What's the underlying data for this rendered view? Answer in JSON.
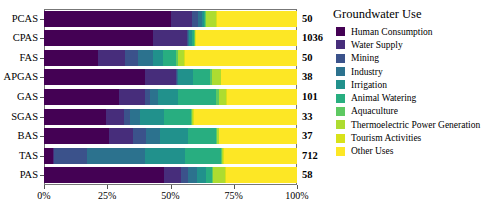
{
  "chart_data": {
    "type": "bar",
    "orientation": "horizontal",
    "stacked": true,
    "normalized": true,
    "title": "",
    "xlabel": "",
    "ylabel": "",
    "xlim": [
      0,
      100
    ],
    "xtick_labels": [
      "0%",
      "25%",
      "50%",
      "75%",
      "100%"
    ],
    "xtick_values": [
      0,
      25,
      50,
      75,
      100
    ],
    "grid": false,
    "legend_position": "right",
    "legend_title": "Groundwater Use",
    "categories": [
      "PCAS",
      "CPAS",
      "FAS",
      "APGAS",
      "GAS",
      "SGAS",
      "BAS",
      "TAS",
      "PAS"
    ],
    "value_labels": [
      "50",
      "1036",
      "50",
      "38",
      "101",
      "33",
      "37",
      "712",
      "58"
    ],
    "series": [
      {
        "name": "Human Consumption",
        "color": "#440154",
        "values": [
          50.0,
          43.0,
          21.5,
          40.0,
          29.5,
          24.5,
          25.5,
          3.5,
          47.5
        ]
      },
      {
        "name": "Water Supply",
        "color": "#472d7b",
        "values": [
          8.5,
          13.5,
          10.5,
          12.0,
          10.5,
          7.0,
          9.5,
          0.6,
          6.5
        ]
      },
      {
        "name": "Mining",
        "color": "#3b528b",
        "values": [
          2.5,
          0.4,
          5.0,
          0.4,
          2.0,
          2.5,
          5.5,
          13.0,
          3.0
        ]
      },
      {
        "name": "Industry",
        "color": "#2c728e",
        "values": [
          1.5,
          0.4,
          6.0,
          0.4,
          3.0,
          4.0,
          5.5,
          23.0,
          3.5
        ]
      },
      {
        "name": "Irrigation",
        "color": "#21918c",
        "values": [
          0.6,
          1.2,
          4.0,
          6.0,
          8.0,
          9.5,
          11.0,
          15.5,
          3.5
        ]
      },
      {
        "name": "Animal Watering",
        "color": "#28ae80",
        "values": [
          0.6,
          0.8,
          5.0,
          7.0,
          15.0,
          10.5,
          11.0,
          14.5,
          2.5
        ]
      },
      {
        "name": "Aquaculture",
        "color": "#5ec962",
        "values": [
          0.5,
          0.3,
          0.8,
          0.5,
          1.0,
          0.5,
          0.5,
          0.4,
          0.5
        ]
      },
      {
        "name": "Thermoelectric Power Generation",
        "color": "#addc30",
        "values": [
          4.0,
          0.3,
          2.5,
          3.5,
          3.0,
          0.5,
          0.5,
          0.4,
          4.5
        ]
      },
      {
        "name": "Tourism Activities",
        "color": "#d8e219",
        "values": [
          0.3,
          0.2,
          0.4,
          0.3,
          0.3,
          0.3,
          0.3,
          0.2,
          0.4
        ]
      },
      {
        "name": "Other Uses",
        "color": "#fde725",
        "values": [
          31.5,
          39.9,
          44.3,
          29.9,
          27.7,
          40.7,
          30.7,
          28.9,
          28.1
        ]
      }
    ]
  }
}
